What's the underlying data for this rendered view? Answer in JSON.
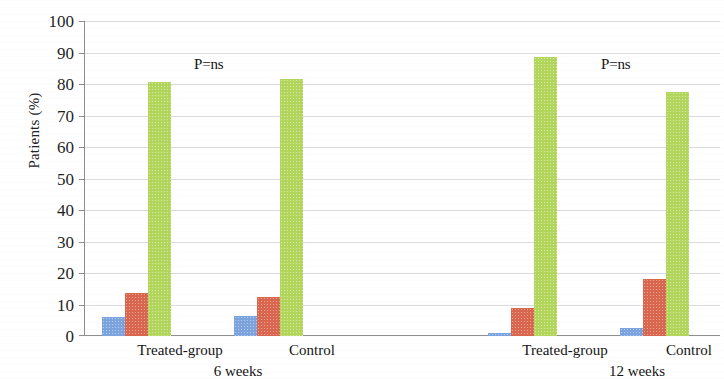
{
  "chart_data": {
    "type": "bar",
    "title": "",
    "xlabel": "",
    "ylabel": "Patients (%)",
    "ylim": [
      0,
      100
    ],
    "ytick_labels": [
      "100",
      "90",
      "80",
      "70",
      "60",
      "50",
      "40",
      "30",
      "20",
      "10",
      "0"
    ],
    "ytick_values": [
      100,
      90,
      80,
      70,
      60,
      50,
      40,
      30,
      20,
      10,
      0
    ],
    "grid": true,
    "legend": false,
    "legend_position": "none",
    "categories": [
      "Treated-group",
      "Control",
      "Treated-group",
      "Control"
    ],
    "period_labels": [
      "6 weeks",
      "12 weeks"
    ],
    "series": [
      {
        "name": "blue",
        "color": "#7ba3dd",
        "values": [
          6,
          6.5,
          1,
          2.5
        ]
      },
      {
        "name": "red",
        "color": "#d9674f",
        "values": [
          13.5,
          12.5,
          9,
          18
        ]
      },
      {
        "name": "green",
        "color": "#b2d65c",
        "values": [
          80.5,
          81.5,
          88.5,
          77.5
        ]
      }
    ],
    "annotations": [
      {
        "text": "P=ns",
        "group": "6 weeks"
      },
      {
        "text": "P=ns",
        "group": "12 weeks"
      }
    ]
  },
  "axis": {
    "y_title": "Patients (%)",
    "ticks": [
      "100",
      "90",
      "80",
      "70",
      "60",
      "50",
      "40",
      "30",
      "20",
      "10",
      "0"
    ]
  },
  "groups": [
    {
      "label": "Treated-group"
    },
    {
      "label": "Control"
    },
    {
      "label": "Treated-group"
    },
    {
      "label": "Control"
    }
  ],
  "periods": [
    {
      "label": "6 weeks"
    },
    {
      "label": "12 weeks"
    }
  ],
  "annotations": [
    {
      "text": "P=ns"
    },
    {
      "text": "P=ns"
    }
  ]
}
